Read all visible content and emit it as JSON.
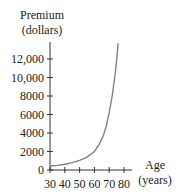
{
  "chart_data": {
    "type": "line",
    "title": "",
    "ylabel": [
      "Premium",
      "(dollars)"
    ],
    "xlabel": [
      "Age",
      "(years)"
    ],
    "xlim": [
      30,
      80
    ],
    "ylim": [
      0,
      14000
    ],
    "x_ticks": [
      "30",
      "40",
      "50",
      "60",
      "70",
      "80"
    ],
    "y_ticks": [
      "0",
      "2000",
      "4000",
      "6000",
      "8000",
      "10,000",
      "12,000"
    ],
    "grid": false,
    "legend": null,
    "series": [
      {
        "name": "Premium",
        "x": [
          30,
          35,
          40,
          45,
          50,
          55,
          60,
          63,
          66,
          68,
          70,
          72,
          74,
          75,
          76
        ],
        "values": [
          430,
          500,
          620,
          800,
          1050,
          1400,
          2000,
          2700,
          3700,
          4700,
          6200,
          8000,
          10300,
          11800,
          13700
        ]
      }
    ],
    "colors": {
      "curve": "#808080",
      "axis": "#333333"
    }
  }
}
